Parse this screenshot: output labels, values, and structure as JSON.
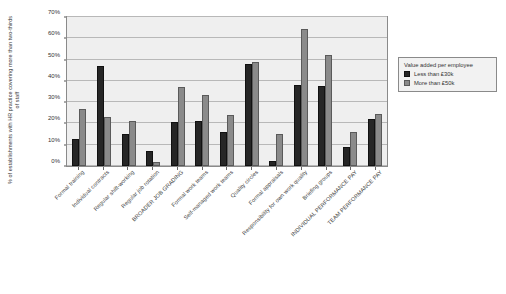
{
  "chart_data": {
    "type": "bar",
    "title": "",
    "xlabel": "",
    "ylabel": "% of establishments with HR practice covering more than two-thirds of staff",
    "ylim": [
      0,
      70
    ],
    "ytick_labels": [
      "0%",
      "10%",
      "20%",
      "30%",
      "40%",
      "50%",
      "60%",
      "70%"
    ],
    "ytick_values": [
      0,
      10,
      20,
      30,
      40,
      50,
      60,
      70
    ],
    "grid": true,
    "legend_position": "right",
    "legend_title": "Value added per employee",
    "categories": [
      "Formal training",
      "Individual contracts",
      "Regular shift-working",
      "Regular job rotation",
      "BROADER JOB GRADING",
      "Formal work teams",
      "Self-managed work teams",
      "Quality circles",
      "Formal appraisals",
      "Responsibility for own work quality",
      "Briefing groups",
      "INDIVIDUAL PERFORMANCE PAY",
      "TEAM PERFORMANCE PAY"
    ],
    "series": [
      {
        "name": "Less than £30k",
        "color": "#262626",
        "values": [
          12.5,
          47,
          15,
          7,
          20.5,
          21,
          16,
          48,
          2.5,
          38,
          37.5,
          9,
          22
        ]
      },
      {
        "name": "More than £50k",
        "color": "#8a8a8a",
        "values": [
          27,
          23,
          21,
          2,
          37,
          33.5,
          24,
          49,
          15,
          64.5,
          52,
          16,
          24.5
        ]
      }
    ]
  }
}
